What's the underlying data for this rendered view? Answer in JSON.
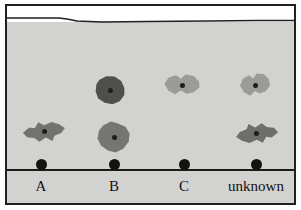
{
  "figure": {
    "name": "tlc-plate",
    "caption": "",
    "background_color": "#ffffff",
    "plate_color": "#d2d2d0",
    "border_color": "#20201e",
    "baseline_color": "#1b1b19",
    "solvent_band_color": "#ffffff"
  },
  "plate": {
    "solvent_front_label": "",
    "baseline_label": ""
  },
  "lanes": [
    {
      "id": "lane-a",
      "label": "A",
      "x": 41,
      "origin_y": 164,
      "spots": [
        {
          "id": "spot-a-1",
          "x": 44,
          "y": 131,
          "rx": 22,
          "ry": 14,
          "color": "#727270",
          "shape": "irregular-1",
          "rotate": -8
        }
      ]
    },
    {
      "id": "lane-b",
      "label": "B",
      "x": 114,
      "origin_y": 164,
      "spots": [
        {
          "id": "spot-b-1",
          "x": 110,
          "y": 90,
          "rx": 16,
          "ry": 15,
          "color": "#4f4f4d",
          "shape": "irregular-2",
          "rotate": 6
        },
        {
          "id": "spot-b-2",
          "x": 114,
          "y": 137,
          "rx": 18,
          "ry": 17,
          "color": "#757573",
          "shape": "irregular-3",
          "rotate": -4
        }
      ]
    },
    {
      "id": "lane-c",
      "label": "C",
      "x": 184,
      "origin_y": 164,
      "spots": [
        {
          "id": "spot-c-1",
          "x": 182,
          "y": 85,
          "rx": 20,
          "ry": 14,
          "color": "#9b9b99",
          "shape": "irregular-4",
          "rotate": 3
        }
      ]
    },
    {
      "id": "lane-unknown",
      "label": "unknown",
      "x": 256,
      "origin_y": 164,
      "spots": [
        {
          "id": "spot-unknown-1",
          "x": 255,
          "y": 85,
          "rx": 17,
          "ry": 15,
          "color": "#9b9b99",
          "shape": "irregular-4",
          "rotate": -5
        },
        {
          "id": "spot-unknown-2",
          "x": 257,
          "y": 134,
          "rx": 22,
          "ry": 14,
          "color": "#6e6e6c",
          "shape": "irregular-1",
          "rotate": 172
        }
      ]
    }
  ]
}
